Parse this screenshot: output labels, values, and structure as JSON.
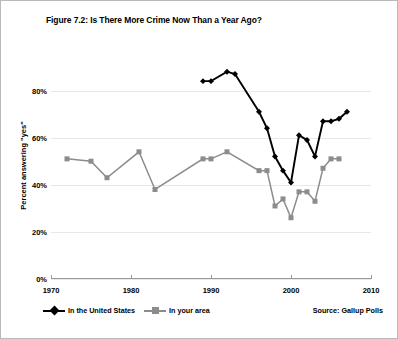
{
  "figure": {
    "title": "Figure 7.2: Is There More Crime Now Than a Year Ago?",
    "source": "Source: Gallup Polls"
  },
  "axes": {
    "ylabel": "Percent answering \"yes\"",
    "ytick_labels": [
      "0%",
      "20%",
      "40%",
      "60%",
      "80%"
    ],
    "xtick_labels": [
      "1970",
      "1980",
      "1990",
      "2000",
      "2010"
    ]
  },
  "legend": {
    "entries": [
      {
        "label": "In the United States",
        "color": "#000000",
        "marker": "diamond"
      },
      {
        "label": "In your area",
        "color": "#8c8c8c",
        "marker": "square"
      }
    ]
  },
  "chart_data": {
    "type": "line",
    "title": "Figure 7.2: Is There More Crime Now Than a Year Ago?",
    "xlabel": "",
    "ylabel": "Percent answering \"yes\"",
    "xlim": [
      1970,
      2010
    ],
    "ylim": [
      0,
      90
    ],
    "xticks": [
      1970,
      1980,
      1990,
      2000,
      2010
    ],
    "yticks": [
      0,
      20,
      40,
      60,
      80
    ],
    "grid": "horizontal",
    "legend_position": "below-left",
    "source": "Source: Gallup Polls",
    "series": [
      {
        "name": "In the United States",
        "color": "#000000",
        "marker": "diamond",
        "points": [
          {
            "x": 1989,
            "y": 84
          },
          {
            "x": 1990,
            "y": 84
          },
          {
            "x": 1992,
            "y": 88
          },
          {
            "x": 1993,
            "y": 87
          },
          {
            "x": 1996,
            "y": 71
          },
          {
            "x": 1997,
            "y": 64
          },
          {
            "x": 1998,
            "y": 52
          },
          {
            "x": 1999,
            "y": 46
          },
          {
            "x": 2000,
            "y": 41
          },
          {
            "x": 2001,
            "y": 61
          },
          {
            "x": 2002,
            "y": 59
          },
          {
            "x": 2003,
            "y": 52
          },
          {
            "x": 2004,
            "y": 67
          },
          {
            "x": 2005,
            "y": 67
          },
          {
            "x": 2006,
            "y": 68
          },
          {
            "x": 2007,
            "y": 71
          }
        ]
      },
      {
        "name": "In your area",
        "color": "#8c8c8c",
        "marker": "square",
        "points": [
          {
            "x": 1972,
            "y": 51
          },
          {
            "x": 1975,
            "y": 50
          },
          {
            "x": 1977,
            "y": 43
          },
          {
            "x": 1981,
            "y": 54
          },
          {
            "x": 1983,
            "y": 38
          },
          {
            "x": 1989,
            "y": 51
          },
          {
            "x": 1990,
            "y": 51
          },
          {
            "x": 1992,
            "y": 54
          },
          {
            "x": 1996,
            "y": 46
          },
          {
            "x": 1997,
            "y": 46
          },
          {
            "x": 1998,
            "y": 31
          },
          {
            "x": 1999,
            "y": 34
          },
          {
            "x": 2000,
            "y": 26
          },
          {
            "x": 2001,
            "y": 37
          },
          {
            "x": 2002,
            "y": 37
          },
          {
            "x": 2003,
            "y": 33
          },
          {
            "x": 2004,
            "y": 47
          },
          {
            "x": 2005,
            "y": 51
          },
          {
            "x": 2006,
            "y": 51
          }
        ]
      }
    ]
  }
}
